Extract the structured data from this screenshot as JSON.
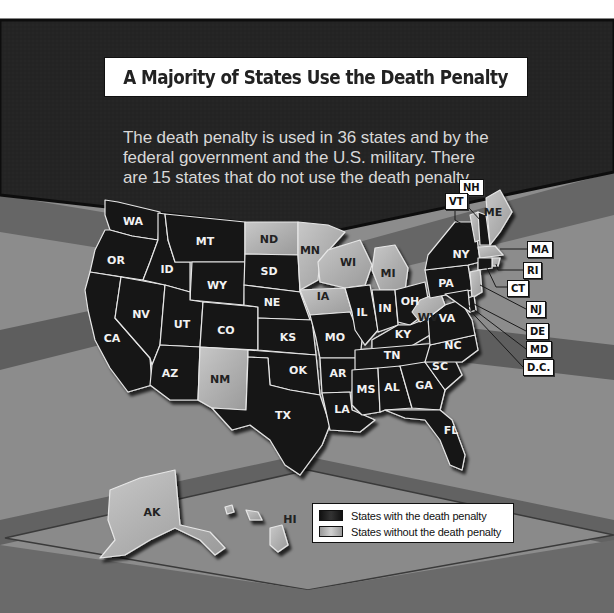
{
  "header": {
    "title": "A Majority of States Use the Death Penalty",
    "subtitle_lines": [
      "The death penalty is used in 36 states and by the",
      "federal government and the U.S. military. There",
      "are 15 states that do not use the death penalty."
    ]
  },
  "colors": {
    "with_death_penalty": "#141414",
    "without_death_penalty": "#b4b4b4",
    "state_border": "#e6e6e6",
    "top_panel": "#222222",
    "band_light": "#8a8a8a",
    "band_dark": "#5c5c5c"
  },
  "legend": {
    "items": [
      {
        "label": "States with the death penalty",
        "status": "with"
      },
      {
        "label": "States without the death penalty",
        "status": "without"
      }
    ]
  },
  "states": {
    "WA": "with",
    "OR": "with",
    "CA": "with",
    "NV": "with",
    "ID": "with",
    "MT": "with",
    "WY": "with",
    "UT": "with",
    "AZ": "with",
    "CO": "with",
    "NM": "without",
    "ND": "without",
    "SD": "with",
    "NE": "with",
    "KS": "with",
    "OK": "with",
    "TX": "with",
    "MN": "without",
    "IA": "without",
    "MO": "with",
    "AR": "with",
    "LA": "with",
    "WI": "without",
    "IL": "with",
    "MI": "without",
    "IN": "with",
    "OH": "with",
    "KY": "with",
    "TN": "with",
    "MS": "with",
    "AL": "with",
    "GA": "with",
    "FL": "with",
    "SC": "with",
    "NC": "with",
    "VA": "with",
    "WV": "without",
    "PA": "with",
    "NY": "with",
    "VT": "without",
    "NH": "with",
    "ME": "without",
    "MA": "without",
    "RI": "without",
    "CT": "with",
    "NJ": "without",
    "DE": "with",
    "MD": "with",
    "D.C.": "without",
    "AK": "without",
    "HI": "without"
  },
  "map_labels": {
    "WA": "WA",
    "OR": "OR",
    "CA": "CA",
    "NV": "NV",
    "ID": "ID",
    "MT": "MT",
    "WY": "WY",
    "UT": "UT",
    "AZ": "AZ",
    "CO": "CO",
    "NM": "NM",
    "ND": "ND",
    "SD": "SD",
    "NE": "NE",
    "KS": "KS",
    "OK": "OK",
    "TX": "TX",
    "MN": "MN",
    "IA": "IA",
    "MO": "MO",
    "AR": "AR",
    "LA": "LA",
    "WI": "WI",
    "IL": "IL",
    "MI": "MI",
    "IN": "IN",
    "OH": "OH",
    "KY": "KY",
    "TN": "TN",
    "MS": "MS",
    "AL": "AL",
    "GA": "GA",
    "FL": "FL",
    "SC": "SC",
    "NC": "NC",
    "VA": "VA",
    "WV": "WV",
    "PA": "PA",
    "NY": "NY",
    "ME": "ME",
    "AK": "AK",
    "HI": "HI"
  },
  "callouts": {
    "NH": "NH",
    "VT": "VT",
    "MA": "MA",
    "RI": "RI",
    "CT": "CT",
    "NJ": "NJ",
    "DE": "DE",
    "MD": "MD",
    "DC": "D.C."
  }
}
